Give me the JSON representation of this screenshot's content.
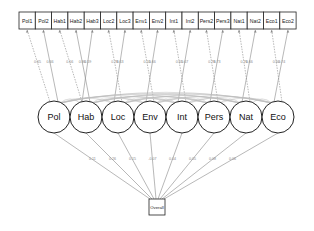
{
  "diagram": {
    "type": "structural-equation-model",
    "indicators": [
      "Pol1",
      "Pol2",
      "Hab1",
      "Hab2",
      "Hab3",
      "Loc2",
      "Loc3",
      "Env1",
      "Env2",
      "Int1",
      "Int2",
      "Pers2",
      "Pers3",
      "Nat1",
      "Nat2",
      "Eco1",
      "Eco2"
    ],
    "latents": [
      "Pol",
      "Hab",
      "Loc",
      "Env",
      "Int",
      "Pers",
      "Nat",
      "Eco"
    ],
    "outcome": "Overall",
    "loading_labels": [
      "0.65",
      "0.66",
      "0.56",
      "0.86",
      "0.59",
      "0.78",
      "0.63",
      "0.55",
      "0.66",
      "0.65",
      "0.67",
      "0.78",
      "0.73",
      "0.76",
      "0.66",
      "0.60",
      "0.74"
    ],
    "structural_labels": [
      "0.11",
      "0.26",
      "0.15",
      "-0.07",
      "0.04",
      "0.05",
      "0.08",
      "0.06"
    ],
    "colors": {
      "edge": "#888888",
      "node_stroke": "#222222",
      "background": "#ffffff"
    }
  }
}
